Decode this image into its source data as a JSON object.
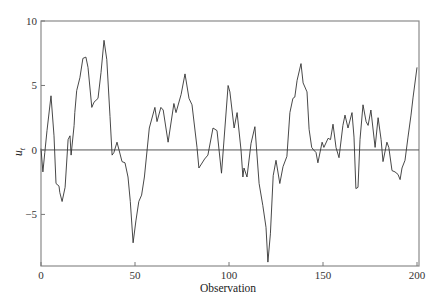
{
  "chart_data": {
    "type": "line",
    "title": "",
    "xlabel": "Observation",
    "ylabel": "u",
    "ylabel_subscript": "t",
    "xlim": [
      0,
      200
    ],
    "ylim": [
      -9,
      10
    ],
    "xticks": [
      0,
      50,
      100,
      150,
      200
    ],
    "yticks": [
      -5,
      0,
      5,
      10
    ],
    "grid": false,
    "zero_line": true,
    "legend": null,
    "series": [
      {
        "name": "u_t",
        "color": "#333333",
        "x": [
          0,
          1,
          2,
          3.2,
          5.3,
          6.9,
          8,
          9.6,
          10,
          11.2,
          12.8,
          14.4,
          15.4,
          16,
          17.6,
          18,
          19,
          20.7,
          22.3,
          23.9,
          25,
          27,
          28.2,
          30.3,
          31.9,
          33.5,
          35,
          36.7,
          37.8,
          38.8,
          40.4,
          41.5,
          43.1,
          44.7,
          46.3,
          47.5,
          49,
          50.5,
          52,
          53.5,
          55,
          57.6,
          60.6,
          61.7,
          63.8,
          65,
          67.6,
          70.7,
          71.8,
          74.5,
          76.6,
          78.7,
          80.3,
          83,
          84,
          87,
          88.8,
          91.5,
          93.6,
          96,
          99.5,
          100.5,
          102.7,
          104.3,
          106.4,
          107.4,
          108,
          109.6,
          111.7,
          113.8,
          116,
          118,
          119.7,
          120.7,
          122,
          123.5,
          125,
          127,
          128.7,
          130.8,
          132.4,
          134,
          135,
          136.2,
          138.3,
          139.4,
          141.5,
          142.6,
          144,
          145,
          146.3,
          147.3,
          149.5,
          150.5,
          152.7,
          154,
          155.3,
          156.9,
          158.5,
          160.6,
          161.7,
          163.3,
          165.4,
          166.5,
          167.5,
          168.6,
          169.7,
          171.3,
          172.9,
          174,
          175.5,
          177.7,
          179.3,
          180.9,
          181.9,
          184,
          185,
          186.7,
          188.3,
          189.9,
          191,
          192,
          193.6,
          195.2,
          196.8,
          197.9,
          200
        ],
        "y": [
          0.1,
          -1.7,
          -0.2,
          1.5,
          4.2,
          1.1,
          -2.6,
          -2.8,
          -3.3,
          -4.0,
          -2.9,
          0.8,
          1.1,
          -0.4,
          1.9,
          2.9,
          4.6,
          5.6,
          7.1,
          7.2,
          6.4,
          3.3,
          3.7,
          4.0,
          6.0,
          8.5,
          7.0,
          2.6,
          -0.4,
          -0.2,
          0.6,
          0.0,
          -0.9,
          -1.0,
          -2.1,
          -4.0,
          -7.2,
          -5.5,
          -4.0,
          -3.5,
          -2.1,
          1.7,
          3.3,
          2.2,
          3.3,
          3.1,
          0.6,
          3.6,
          2.9,
          4.3,
          5.9,
          4.0,
          3.5,
          0.2,
          -1.4,
          -0.7,
          -0.4,
          1.7,
          1.5,
          -1.8,
          5.0,
          4.5,
          1.7,
          2.9,
          0.0,
          -2.1,
          -1.4,
          -2.1,
          0.5,
          1.8,
          -2.6,
          -4.3,
          -6.0,
          -8.7,
          -6.5,
          -2.0,
          -0.8,
          -2.6,
          -1.3,
          -0.5,
          2.9,
          4.0,
          4.1,
          5.4,
          6.7,
          5.2,
          4.5,
          1.6,
          0.2,
          0.0,
          -0.2,
          -1.0,
          0.6,
          0.2,
          0.9,
          0.8,
          2.0,
          0.2,
          -0.6,
          1.9,
          2.7,
          1.7,
          2.9,
          1.0,
          -3.0,
          -2.9,
          0.8,
          3.5,
          2.2,
          1.9,
          3.1,
          0.2,
          2.5,
          0.8,
          -0.9,
          0.6,
          0.2,
          -1.6,
          -1.7,
          -1.9,
          -2.3,
          -1.4,
          -0.8,
          1.0,
          2.7,
          4.1,
          6.4
        ]
      }
    ]
  },
  "axes": {
    "x_tick_labels": [
      "0",
      "50",
      "100",
      "150",
      "200"
    ],
    "y_tick_labels": [
      "−5",
      "0",
      "5",
      "10"
    ]
  }
}
